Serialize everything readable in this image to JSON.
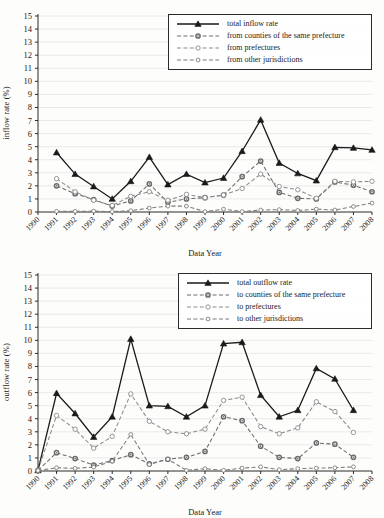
{
  "figure": {
    "xlabel": "Data Year",
    "years": [
      "1990",
      "1991",
      "1992",
      "1993",
      "1994",
      "1995",
      "1996",
      "1997",
      "1998",
      "1999",
      "2000",
      "2001",
      "2002",
      "2003",
      "2004",
      "2005",
      "2006",
      "2007",
      "2008"
    ],
    "yticks": [
      "0",
      "1",
      "2",
      "3",
      "4",
      "5",
      "6",
      "7",
      "8",
      "9",
      "10",
      "11",
      "12",
      "13",
      "14",
      "15"
    ]
  },
  "chart_data": [
    {
      "type": "line",
      "title": "",
      "xlabel": "Data Year",
      "ylabel": "inflow rate (%)",
      "ylim": [
        0,
        15
      ],
      "grid": true,
      "legend_position": "top-right",
      "x": [
        "1990",
        "1991",
        "1992",
        "1993",
        "1994",
        "1995",
        "1996",
        "1997",
        "1998",
        "1999",
        "2000",
        "2001",
        "2002",
        "2003",
        "2004",
        "2005",
        "2006",
        "2007",
        "2008"
      ],
      "series": [
        {
          "name": "total inflow rate",
          "marker": "triangle",
          "style": "solid",
          "color": "#1a1a1a",
          "values": [
            null,
            4.55,
            2.9,
            1.95,
            1.0,
            2.35,
            4.2,
            2.1,
            2.9,
            2.25,
            2.6,
            4.65,
            7.05,
            3.75,
            2.95,
            2.4,
            4.95,
            4.9,
            4.75
          ]
        },
        {
          "name": "from counties of the same prefecture",
          "marker": "circle-filled",
          "style": "dashed",
          "color": "#6b6b6b",
          "values": [
            null,
            2.0,
            1.4,
            0.95,
            0.45,
            0.85,
            2.15,
            0.75,
            1.0,
            1.1,
            1.3,
            2.7,
            3.9,
            1.5,
            1.05,
            1.0,
            2.3,
            2.05,
            1.55
          ]
        },
        {
          "name": "from prefectures",
          "marker": "circle-open",
          "style": "dashed",
          "color": "#8a8a8a",
          "values": [
            null,
            2.55,
            1.55,
            0.9,
            0.5,
            1.2,
            1.55,
            0.9,
            1.35,
            1.1,
            1.3,
            1.8,
            2.9,
            1.95,
            1.7,
            1.05,
            2.35,
            2.3,
            2.35
          ]
        },
        {
          "name": "from other jurisdictions",
          "marker": "circle-open-small",
          "style": "dashed",
          "color": "#7a7a7a",
          "values": [
            null,
            0.05,
            0.05,
            0.07,
            0.03,
            0.1,
            0.3,
            0.45,
            0.45,
            0.03,
            0.22,
            0.03,
            0.15,
            0.18,
            0.12,
            0.22,
            0.15,
            0.42,
            0.68
          ]
        }
      ]
    },
    {
      "type": "line",
      "title": "",
      "xlabel": "Data Year",
      "ylabel": "outflow rate (%)",
      "ylim": [
        0,
        15
      ],
      "grid": true,
      "legend_position": "top-right",
      "x": [
        "1990",
        "1991",
        "1992",
        "1993",
        "1994",
        "1995",
        "1996",
        "1997",
        "1998",
        "1999",
        "2000",
        "2001",
        "2002",
        "2003",
        "2004",
        "2005",
        "2006",
        "2007",
        "2008"
      ],
      "series": [
        {
          "name": "total outflow rate",
          "marker": "triangle",
          "style": "solid",
          "color": "#1a1a1a",
          "values": [
            0.05,
            5.95,
            4.4,
            2.6,
            4.15,
            10.1,
            5.0,
            4.95,
            4.15,
            5.0,
            9.75,
            9.85,
            5.8,
            4.15,
            4.65,
            7.85,
            7.05,
            4.65,
            null
          ]
        },
        {
          "name": "to counties of the same prefecture",
          "marker": "circle-filled",
          "style": "dashed",
          "color": "#6b6b6b",
          "values": [
            0.05,
            1.4,
            0.95,
            0.45,
            0.8,
            1.25,
            0.55,
            0.9,
            1.05,
            1.5,
            4.15,
            3.85,
            1.9,
            1.05,
            0.95,
            2.15,
            2.05,
            1.05,
            null
          ]
        },
        {
          "name": "to prefectures",
          "marker": "circle-open",
          "style": "dashed",
          "color": "#8a8a8a",
          "values": [
            0.05,
            4.25,
            3.2,
            1.75,
            2.65,
            5.9,
            3.8,
            3.0,
            2.85,
            3.2,
            5.4,
            5.65,
            3.4,
            2.85,
            3.3,
            5.3,
            4.55,
            2.95,
            null
          ]
        },
        {
          "name": "to other jurisdictions",
          "marker": "circle-open-small",
          "style": "dashed",
          "color": "#7a7a7a",
          "values": [
            0.03,
            0.25,
            0.2,
            0.3,
            0.75,
            2.8,
            0.5,
            0.9,
            0.05,
            0.18,
            0.05,
            0.22,
            0.32,
            0.1,
            0.18,
            0.22,
            0.25,
            0.32,
            null
          ]
        }
      ]
    }
  ]
}
